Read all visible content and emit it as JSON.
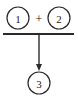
{
  "diagram": {
    "type": "petri-net-transition",
    "background_color": "#ffffff",
    "stroke_color": "#2b2b2b",
    "text_color": "#1a1a1a",
    "nodes": [
      {
        "id": "input-1",
        "label": "1",
        "role": "input-place",
        "cx": 18,
        "cy": 18,
        "r": 11
      },
      {
        "id": "input-2",
        "label": "2",
        "role": "input-place",
        "cx": 59,
        "cy": 18,
        "r": 11
      },
      {
        "id": "output-3",
        "label": "3",
        "role": "output-place",
        "cx": 39,
        "cy": 83,
        "r": 11
      }
    ],
    "operator": {
      "label": "+",
      "cx": 39,
      "cy": 18
    },
    "transition_bar": {
      "x1": 3,
      "x2": 74,
      "y": 34
    },
    "arrow": {
      "x": 39,
      "y1": 34,
      "y2": 71,
      "head_width": 6,
      "head_height": 7
    }
  }
}
